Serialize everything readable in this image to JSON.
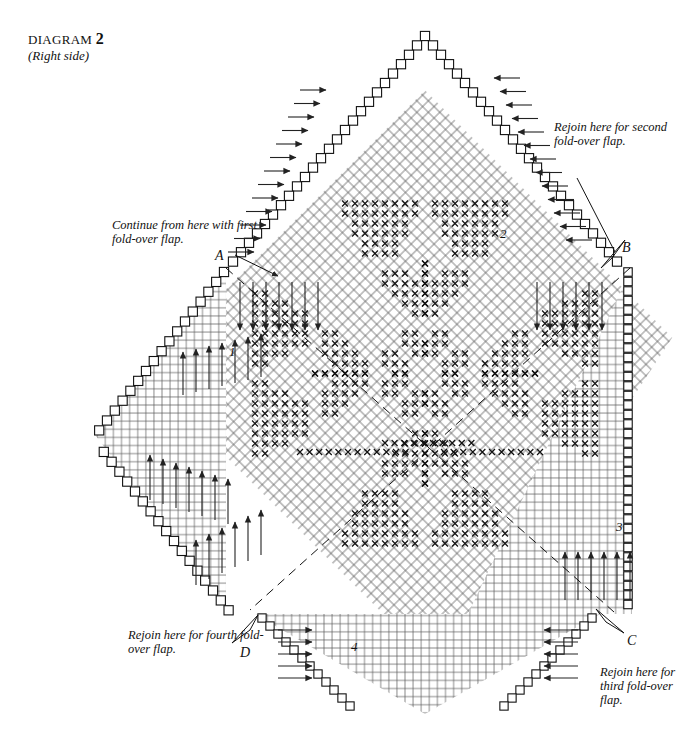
{
  "title": {
    "label": "DIAGRAM",
    "number": "2",
    "subtitle": "(Right side)"
  },
  "annotations": [
    {
      "id": "note-first-flap",
      "text": "Continue from here with first fold-over flap."
    },
    {
      "id": "note-second-flap",
      "text": "Rejoin here for second fold-over flap."
    },
    {
      "id": "note-third-flap",
      "text": "Rejoin here for third fold-over flap."
    },
    {
      "id": "note-fourth-flap",
      "text": "Rejoin here for fourth fold-over flap."
    }
  ],
  "points": [
    {
      "id": "point-a",
      "label": "A"
    },
    {
      "id": "point-b",
      "label": "B"
    },
    {
      "id": "point-c",
      "label": "C"
    },
    {
      "id": "point-d",
      "label": "D"
    }
  ],
  "quadrants": [
    {
      "id": "quadrant-1",
      "label": "1"
    },
    {
      "id": "quadrant-2",
      "label": "2"
    },
    {
      "id": "quadrant-3",
      "label": "3"
    },
    {
      "id": "quadrant-4",
      "label": "4"
    }
  ],
  "chart_data": {
    "type": "heatmap",
    "title": "DIAGRAM 2 (Right side)",
    "symbols": {
      "x": "marked stitch (pattern stitch)",
      "blank": "plain stitch",
      "arrow": "row direction"
    },
    "grid": {
      "cell_px": 8.1,
      "rotation_deg": 45,
      "columns": 60,
      "rows": 60
    },
    "axis": {
      "grid": true,
      "xlabel": "",
      "ylabel": ""
    },
    "legend": {
      "position": "none",
      "entries": []
    },
    "arrow_directions": [
      "right",
      "left",
      "up",
      "down"
    ],
    "fold_lines": 4,
    "colors": {
      "ink": "#121212",
      "grid": "#4a4a4a",
      "paper": "#ffffff"
    }
  }
}
